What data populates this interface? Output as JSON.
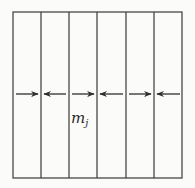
{
  "diagram": {
    "box": {
      "x": 13,
      "y": 12,
      "width": 169,
      "height": 166
    },
    "strip_count": 6,
    "divider_x": [
      41,
      69,
      97,
      126,
      154
    ],
    "arrow_y": 94,
    "arrows": [
      {
        "from": 16,
        "to": 38,
        "direction": "right"
      },
      {
        "from": 66,
        "to": 44,
        "direction": "left"
      },
      {
        "from": 72,
        "to": 94,
        "direction": "right"
      },
      {
        "from": 123,
        "to": 100,
        "direction": "left"
      },
      {
        "from": 129,
        "to": 151,
        "direction": "right"
      },
      {
        "from": 180,
        "to": 157,
        "direction": "left"
      }
    ],
    "label": {
      "base": "m",
      "subscript": "j"
    },
    "colors": {
      "stroke": "#3a3a3a",
      "background": "#fbfbfa"
    }
  }
}
